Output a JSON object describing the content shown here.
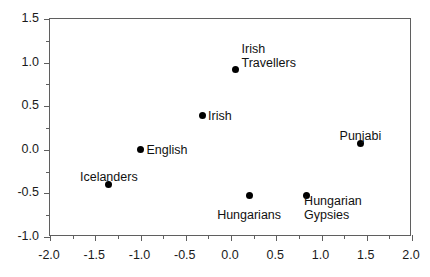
{
  "chart_data": {
    "type": "scatter",
    "title": "",
    "xlabel": "",
    "ylabel": "",
    "xlim": [
      -2.0,
      2.0
    ],
    "ylim": [
      -1.0,
      1.5
    ],
    "xticks": [
      "-2.0",
      "-1.5",
      "-1.0",
      "-0.5",
      "0.0",
      "0.5",
      "1.0",
      "1.5",
      "2.0"
    ],
    "xtick_values": [
      -2.0,
      -1.5,
      -1.0,
      -0.5,
      0.0,
      0.5,
      1.0,
      1.5,
      2.0
    ],
    "yticks": [
      "-1.0",
      "-0.5",
      "0.0",
      "0.5",
      "1.0",
      "1.5"
    ],
    "ytick_values": [
      -1.0,
      -0.5,
      0.0,
      0.5,
      1.0,
      1.5
    ],
    "grid": false,
    "legend": "none",
    "marker": "filled-circle",
    "marker_color": "#000000",
    "frame_color": "#5f5f5f",
    "points": [
      {
        "label": "Irish\nTravellers",
        "label_lines": [
          "Irish",
          "Travellers"
        ],
        "x": 0.05,
        "y": 0.92,
        "label_anchor": "left",
        "label_dx": 6,
        "label_dy": 0
      },
      {
        "label": "Irish",
        "label_lines": [
          "Irish"
        ],
        "x": -0.32,
        "y": 0.39,
        "label_anchor": "left",
        "label_dx": 6,
        "label_dy": 0
      },
      {
        "label": "English",
        "label_lines": [
          "English"
        ],
        "x": -1.0,
        "y": 0.0,
        "label_anchor": "left",
        "label_dx": 6,
        "label_dy": 0
      },
      {
        "label": "Icelanders",
        "label_lines": [
          "Icelanders"
        ],
        "x": -1.35,
        "y": -0.4,
        "label_anchor": "center",
        "label_dx": 0,
        "label_dy": -15
      },
      {
        "label": "Punjabi",
        "label_lines": [
          "Punjabi"
        ],
        "x": 1.43,
        "y": 0.07,
        "label_anchor": "center",
        "label_dx": 0,
        "label_dy": -15
      },
      {
        "label": "Hungarians",
        "label_lines": [
          "Hungarians"
        ],
        "x": 0.2,
        "y": -0.52,
        "label_anchor": "center",
        "label_dx": 0,
        "label_dy": 13
      },
      {
        "label": "Hungarian\nGypsies",
        "label_lines": [
          "Hungarian",
          "Gypsies"
        ],
        "x": 0.83,
        "y": -0.52,
        "label_anchor": "left",
        "label_dx": -2,
        "label_dy": 13
      }
    ]
  }
}
